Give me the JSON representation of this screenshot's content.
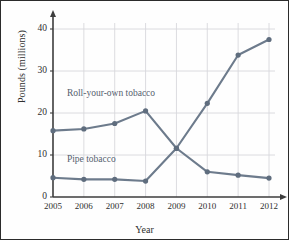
{
  "chart_data": {
    "type": "line",
    "title": "",
    "xlabel": "Year",
    "ylabel": "Pounds (millions)",
    "x": [
      2005,
      2006,
      2007,
      2008,
      2009,
      2010,
      2011,
      2012
    ],
    "xticklabels": [
      "2005",
      "2006",
      "2007",
      "2008",
      "2009",
      "2010",
      "2011",
      "2012"
    ],
    "yticklabels": [
      "0",
      "10",
      "20",
      "30",
      "40"
    ],
    "yticks": [
      0,
      10,
      20,
      30,
      40
    ],
    "ylim": [
      0,
      42
    ],
    "xlim": [
      2005,
      2012
    ],
    "grid": true,
    "legend_position": "inline-annotations",
    "series": [
      {
        "name": "Roll-your-own tobacco",
        "values": [
          15.8,
          16.2,
          17.5,
          20.5,
          11.6,
          6.0,
          5.2,
          4.5
        ],
        "color": "#6d7b8c",
        "annotation": "Roll-your-own tobacco"
      },
      {
        "name": "Pipe tobacco",
        "values": [
          4.6,
          4.2,
          4.2,
          3.8,
          11.6,
          22.3,
          33.8,
          37.5
        ],
        "color": "#6d7b8c",
        "annotation": "Pipe tobacco"
      }
    ],
    "annotations": [
      {
        "text": "Roll-your-own tobacco",
        "x": 2005.45,
        "y": 24.2
      },
      {
        "text": "Pipe tobacco",
        "x": 2005.45,
        "y": 8.6
      }
    ],
    "colors": {
      "line": "#6d7b8c",
      "marker": "#5f6d7e",
      "grid": "#d8d8dc",
      "axis": "#3d3d3d",
      "text": "#2f2f2f",
      "border": "#2b2b2b",
      "background": "#fefefe"
    }
  }
}
